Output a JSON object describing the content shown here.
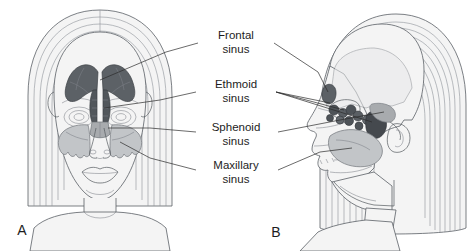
{
  "figure": {
    "background_color": "#ffffff",
    "width": 473,
    "height": 251
  },
  "panels": [
    {
      "id": "A",
      "label": "A",
      "view": "anterior frontal view of female head",
      "label_x": 22,
      "label_y": 231
    },
    {
      "id": "B",
      "label": "B",
      "view": "lateral profile view of female head",
      "label_x": 276,
      "label_y": 233
    }
  ],
  "labels": [
    {
      "name": "frontal-sinus",
      "line1": "Frontal",
      "line2": "sinus",
      "x": 236,
      "y1": 36,
      "y2": 50,
      "color": "#3f4348"
    },
    {
      "name": "ethmoid-sinus",
      "line1": "Ethmoid",
      "line2": "sinus",
      "x": 236,
      "y1": 85,
      "y2": 99,
      "color": "#53575c"
    },
    {
      "name": "sphenoid-sinus",
      "line1": "Sphenoid",
      "line2": "sinus",
      "x": 236,
      "y1": 128,
      "y2": 142,
      "color": "#9fa3a7"
    },
    {
      "name": "maxillary-sinus",
      "line1": "Maxillary",
      "line2": "sinus",
      "x": 236,
      "y1": 166,
      "y2": 180,
      "color": "#b9bcbf"
    }
  ],
  "colors": {
    "frontal_sinus_fill": "#5c6166",
    "ethmoid_sinus_fill": "#4e5358",
    "sphenoid_sinus_fill": "#a8abae",
    "maxillary_sinus_fill": "#c2c5c8",
    "skin_fill": "#f4f4f4",
    "skull_fill": "#e8e9ea",
    "outline": "#5b6066",
    "hair_line": "#8d9298",
    "text": "#1d1d1d"
  }
}
